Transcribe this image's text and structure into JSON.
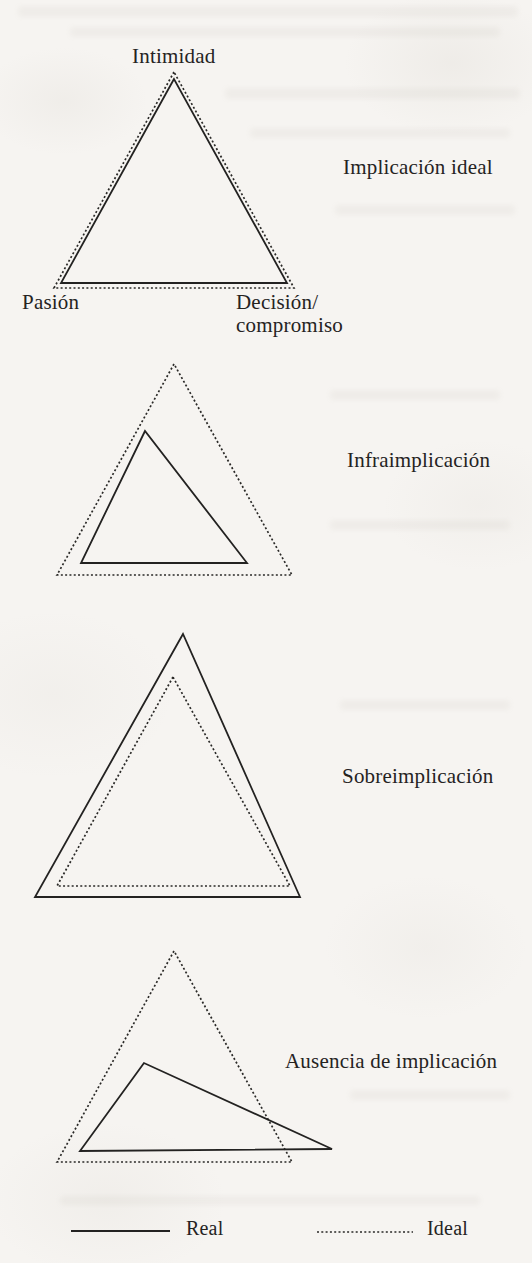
{
  "palette": {
    "paper": "#f6f4f1",
    "ink": "#232221"
  },
  "figure": {
    "corner_labels": {
      "intimacy": "Intimidad",
      "passion": "Pasión",
      "decision_line1": "Decisión/",
      "decision_line2": "compromiso"
    },
    "sections": [
      {
        "label": "Implicación ideal",
        "real_vs_ideal": "equal-overlapping"
      },
      {
        "label": "Infraimplicación",
        "real_vs_ideal": "real-smaller-inside-ideal"
      },
      {
        "label": "Sobreimplicación",
        "real_vs_ideal": "real-larger-outside-ideal"
      },
      {
        "label": "Ausencia de implicación",
        "real_vs_ideal": "real-displaced-skewed-right"
      }
    ],
    "legend": [
      {
        "style": "solid",
        "label": "Real"
      },
      {
        "style": "dotted",
        "label": "Ideal"
      }
    ]
  }
}
